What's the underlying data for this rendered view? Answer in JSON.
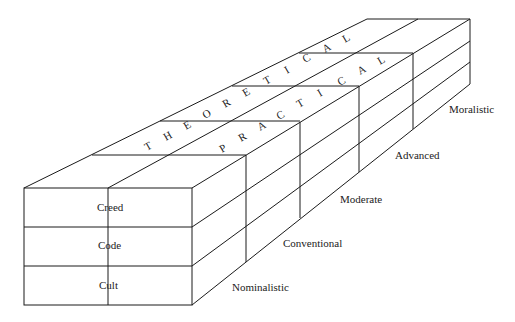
{
  "diagram": {
    "type": "isometric-box-diagram",
    "top_labels": {
      "theoretical": [
        "T",
        "H",
        "E",
        "O",
        "R",
        "E",
        "T",
        "I",
        "C",
        "A",
        "L"
      ],
      "practical": [
        "P",
        "R",
        "A",
        "C",
        "T",
        "I",
        "C",
        "A",
        "L"
      ]
    },
    "front_rows": [
      {
        "label": "Creed"
      },
      {
        "label": "Code"
      },
      {
        "label": "Cult"
      }
    ],
    "depth_segments": [
      {
        "label": "Nominalistic"
      },
      {
        "label": "Conventional"
      },
      {
        "label": "Moderate"
      },
      {
        "label": "Advanced"
      },
      {
        "label": "Moralistic"
      }
    ],
    "colors": {
      "line": "#1a1a1a",
      "background": "#ffffff",
      "text": "#222222"
    }
  }
}
